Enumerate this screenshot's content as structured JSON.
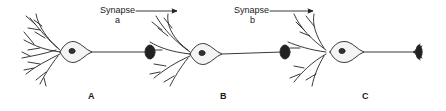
{
  "diagram": {
    "type": "neuron chain",
    "neurons": [
      {
        "id": "A",
        "label": "A"
      },
      {
        "id": "B",
        "label": "B"
      },
      {
        "id": "C",
        "label": "C"
      }
    ],
    "synapses": [
      {
        "label": "Synapse",
        "sub": "a",
        "arrow": "right"
      },
      {
        "label": "Synapse",
        "sub": "b",
        "arrow": "right"
      }
    ]
  }
}
